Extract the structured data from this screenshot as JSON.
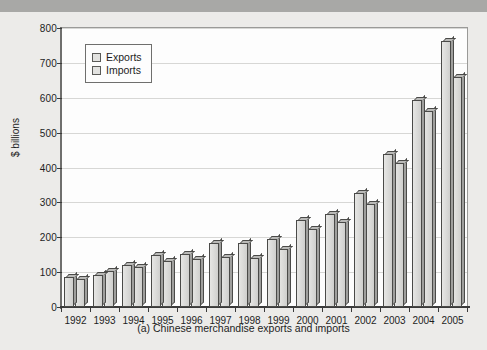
{
  "figure": {
    "caption": "(a)  Chinese merchandise exports and imports",
    "ylabel": "$ billions"
  },
  "legend": {
    "items": [
      {
        "label": "Exports",
        "color": "#e2e2e0"
      },
      {
        "label": "Imports",
        "color": "#e2e2e0"
      }
    ]
  },
  "chart_data": {
    "type": "bar",
    "title": "(a)  Chinese merchandise exports and imports",
    "xlabel": "",
    "ylabel": "$ billions",
    "ylim": [
      0,
      800
    ],
    "ytick_step": 100,
    "yticks": [
      0,
      100,
      200,
      300,
      400,
      500,
      600,
      700,
      800
    ],
    "grid": true,
    "legend_position": "top-left",
    "categories": [
      "1992",
      "1993",
      "1994",
      "1995",
      "1996",
      "1997",
      "1998",
      "1999",
      "2000",
      "2001",
      "2002",
      "2003",
      "2004",
      "2005"
    ],
    "series": [
      {
        "name": "Exports",
        "values": [
          85,
          92,
          121,
          149,
          151,
          183,
          184,
          195,
          249,
          266,
          326,
          438,
          593,
          762
        ]
      },
      {
        "name": "Imports",
        "values": [
          81,
          104,
          116,
          132,
          138,
          142,
          140,
          166,
          225,
          244,
          295,
          413,
          561,
          660
        ]
      }
    ]
  }
}
